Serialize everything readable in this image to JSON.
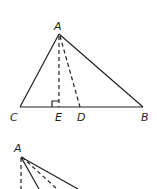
{
  "figure1": {
    "labels": {
      "A": "A",
      "C": "C",
      "E": "E",
      "D": "D",
      "B": "B"
    },
    "description": "Triangle ABC with altitude AE (dashed, right angle at E) and segment AD (dashed) to base CB"
  },
  "figure2": {
    "labels": {
      "A": "A"
    },
    "description": "Partial view of vertex A with dashed and solid lines"
  },
  "colors": {
    "stroke": "#231f20",
    "background": "#ffffff"
  }
}
